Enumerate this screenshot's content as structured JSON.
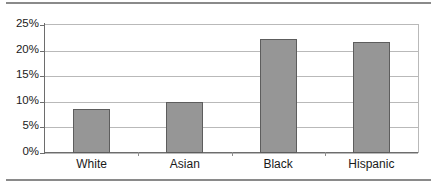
{
  "chart_data": {
    "type": "bar",
    "title": "",
    "subtitle": "",
    "xlabel": "",
    "ylabel": "",
    "categories": [
      "White",
      "Asian",
      "Black",
      "Hispanic"
    ],
    "values": [
      8.6,
      10.0,
      22.3,
      21.7
    ],
    "value_labels": [
      "8.6%",
      "10.0%",
      "22.3%",
      "21.7%"
    ],
    "ylim": [
      0,
      25
    ],
    "ytick_values": [
      0,
      5,
      10,
      15,
      20,
      25
    ],
    "ytick_labels": [
      "0%",
      "5%",
      "10%",
      "15%",
      "20%",
      "25%"
    ],
    "grid": "horizontal",
    "legend": "none",
    "series": [
      {
        "name": "",
        "values": [
          8.6,
          10.0,
          22.3,
          21.7
        ]
      }
    ],
    "colors": {
      "bar_fill": "#969696",
      "bar_border": "#5d5d5d",
      "gridline": "#b9b9b9",
      "axis": "#6d6d6d",
      "text": "#1a1a1a",
      "rule": "#8a8a8a",
      "background": "#ffffff"
    }
  }
}
